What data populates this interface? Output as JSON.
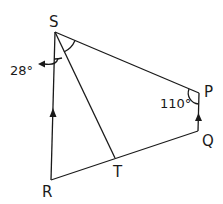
{
  "diagram": {
    "vertices": {
      "S": {
        "label": "S",
        "x": 55,
        "y": 32
      },
      "P": {
        "label": "P",
        "x": 199,
        "y": 93
      },
      "Q": {
        "label": "Q",
        "x": 198,
        "y": 131
      },
      "R": {
        "label": "R",
        "x": 51,
        "y": 180
      },
      "T": {
        "label": "T",
        "x": 115,
        "y": 158
      }
    },
    "angles": {
      "RST": {
        "label": "28°"
      },
      "SPQ": {
        "label": "110°"
      }
    },
    "parallel_marks": [
      "RS",
      "QP"
    ],
    "equal_angle_marks": [
      "RST",
      "TSP"
    ],
    "line_color": "#1a1a1a"
  }
}
